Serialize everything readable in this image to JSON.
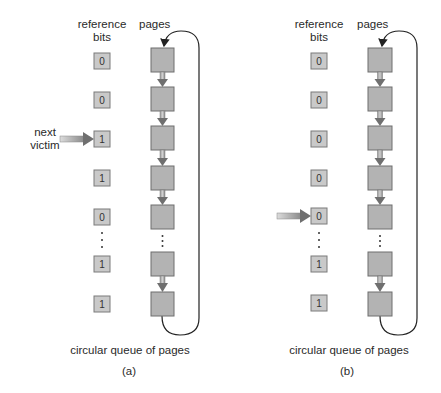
{
  "figure": {
    "panels": [
      {
        "id": "a",
        "caption": "(a)",
        "header_reference": "reference",
        "header_bits": "bits",
        "header_pages": "pages",
        "queue_label": "circular queue of pages",
        "pointer_label_line1": "next",
        "pointer_label_line2": "victim",
        "pointer_index": 2,
        "reference_bits": [
          "0",
          "0",
          "1",
          "1",
          "0",
          "1",
          "1"
        ],
        "page_count": 7
      },
      {
        "id": "b",
        "caption": "(b)",
        "header_reference": "reference",
        "header_bits": "bits",
        "header_pages": "pages",
        "queue_label": "circular queue of pages",
        "pointer_label_line1": "",
        "pointer_label_line2": "",
        "pointer_index": 4,
        "reference_bits": [
          "0",
          "0",
          "0",
          "0",
          "0",
          "1",
          "1"
        ],
        "page_count": 7
      }
    ],
    "ellipsis": "⋮",
    "colors": {
      "page_fill": "#b3b3b3",
      "page_border": "#6e6e6e",
      "bit_fill": "#c9c9c9",
      "arrow_dark": "#6f6f6f",
      "arrow_light": "#d8d8d8",
      "line": "#222222"
    }
  }
}
